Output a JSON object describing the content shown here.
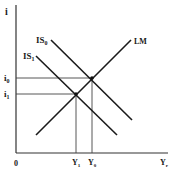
{
  "diagram": {
    "type": "IS-LM",
    "axes": {
      "y_label": "i",
      "x_label": "Yr",
      "origin_label": "0"
    },
    "curves": [
      {
        "id": "IS0",
        "label": "IS",
        "sub": "0"
      },
      {
        "id": "IS1",
        "label": "IS",
        "sub": "1"
      },
      {
        "id": "LM",
        "label": "LM",
        "sub": ""
      }
    ],
    "y_ticks": [
      {
        "label": "i",
        "sub": "0"
      },
      {
        "label": "i",
        "sub": "1"
      }
    ],
    "x_ticks": [
      {
        "label": "Y",
        "sub": "1"
      },
      {
        "label": "Y",
        "sub": "0"
      },
      {
        "label": "Y",
        "sub": "r"
      }
    ],
    "equilibria": [
      {
        "name": "E0",
        "at": "i0,Y0"
      },
      {
        "name": "E1",
        "at": "i1,Y1"
      }
    ],
    "colors": {
      "line": "#1a1a1a",
      "background": "#ffffff"
    }
  }
}
